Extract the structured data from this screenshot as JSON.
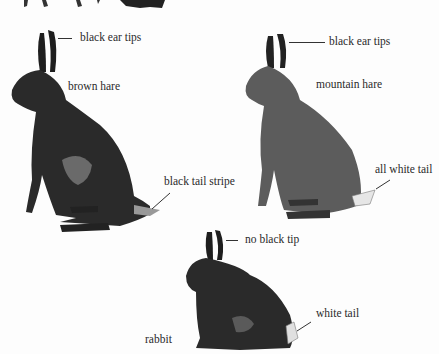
{
  "figure": {
    "animals": [
      {
        "name": "brown hare",
        "labels": {
          "ears": "black ear tips",
          "tail": "black tail stripe"
        }
      },
      {
        "name": "mountain hare",
        "labels": {
          "ears": "black ear tips",
          "tail": "all white tail"
        }
      },
      {
        "name": "rabbit",
        "labels": {
          "ears": "no black tip",
          "tail": "white tail"
        }
      }
    ],
    "colors": {
      "ink": "#1a1a1a",
      "paper": "#fdfdfd"
    }
  }
}
